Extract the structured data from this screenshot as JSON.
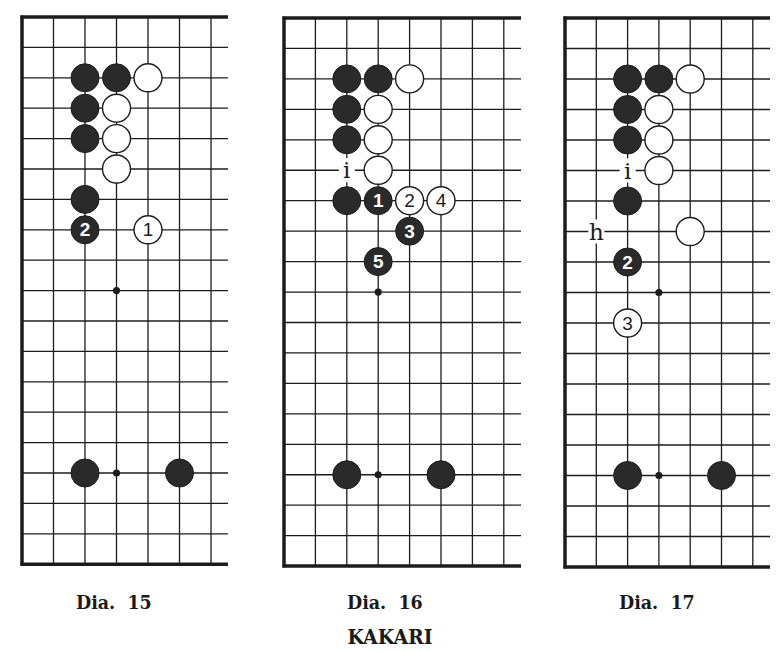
{
  "title": "KAKARI",
  "colors": {
    "ink": "#1c1c1c",
    "paper": "#ffffff",
    "black_stone": "#2a2a2a",
    "white_stone": "#ffffff"
  },
  "diagrams": [
    {
      "id": "dia-15",
      "caption": "Dia.  15",
      "caption_pos": {
        "x": 76,
        "y": 591
      },
      "origin": {
        "x": 22,
        "y": 17
      },
      "col_spacing": 31.5,
      "row_spacing": 30.4,
      "cols": 7,
      "rows": 19,
      "right_extent": 228,
      "star_points": [
        [
          3,
          9
        ],
        [
          3,
          15
        ]
      ],
      "stones": [
        {
          "c": 2,
          "r": 2,
          "color": "black"
        },
        {
          "c": 3,
          "r": 2,
          "color": "black"
        },
        {
          "c": 4,
          "r": 2,
          "color": "white"
        },
        {
          "c": 2,
          "r": 3,
          "color": "black"
        },
        {
          "c": 3,
          "r": 3,
          "color": "white"
        },
        {
          "c": 2,
          "r": 4,
          "color": "black"
        },
        {
          "c": 3,
          "r": 4,
          "color": "white"
        },
        {
          "c": 3,
          "r": 5,
          "color": "white"
        },
        {
          "c": 2,
          "r": 6,
          "color": "black"
        },
        {
          "c": 2,
          "r": 7,
          "color": "black",
          "label": "2"
        },
        {
          "c": 4,
          "r": 7,
          "color": "white",
          "label": "1"
        },
        {
          "c": 2,
          "r": 15,
          "color": "black"
        },
        {
          "c": 5,
          "r": 15,
          "color": "black"
        }
      ],
      "marks": []
    },
    {
      "id": "dia-16",
      "caption": "Dia.  16",
      "caption_pos": {
        "x": 347,
        "y": 591
      },
      "origin": {
        "x": 284,
        "y": 18
      },
      "col_spacing": 31.4,
      "row_spacing": 30.45,
      "cols": 8,
      "rows": 19,
      "right_extent": 521,
      "star_points": [
        [
          3,
          9
        ],
        [
          3,
          15
        ]
      ],
      "stones": [
        {
          "c": 2,
          "r": 2,
          "color": "black"
        },
        {
          "c": 3,
          "r": 2,
          "color": "black"
        },
        {
          "c": 4,
          "r": 2,
          "color": "white"
        },
        {
          "c": 2,
          "r": 3,
          "color": "black"
        },
        {
          "c": 3,
          "r": 3,
          "color": "white"
        },
        {
          "c": 2,
          "r": 4,
          "color": "black"
        },
        {
          "c": 3,
          "r": 4,
          "color": "white"
        },
        {
          "c": 3,
          "r": 5,
          "color": "white"
        },
        {
          "c": 2,
          "r": 6,
          "color": "black"
        },
        {
          "c": 3,
          "r": 6,
          "color": "black",
          "label": "1"
        },
        {
          "c": 4,
          "r": 6,
          "color": "white",
          "label": "2"
        },
        {
          "c": 5,
          "r": 6,
          "color": "white",
          "label": "4"
        },
        {
          "c": 4,
          "r": 7,
          "color": "black",
          "label": "3"
        },
        {
          "c": 3,
          "r": 8,
          "color": "black",
          "label": "5"
        },
        {
          "c": 2,
          "r": 15,
          "color": "black"
        },
        {
          "c": 5,
          "r": 15,
          "color": "black"
        }
      ],
      "marks": [
        {
          "c": 2,
          "r": 5,
          "label": "i"
        }
      ]
    },
    {
      "id": "dia-17",
      "caption": "Dia.  17",
      "caption_pos": {
        "x": 619,
        "y": 591
      },
      "origin": {
        "x": 565,
        "y": 18
      },
      "col_spacing": 31.3,
      "row_spacing": 30.5,
      "cols": 7,
      "rows": 19,
      "right_extent": 770,
      "star_points": [
        [
          3,
          9
        ],
        [
          3,
          15
        ]
      ],
      "stones": [
        {
          "c": 2,
          "r": 2,
          "color": "black"
        },
        {
          "c": 3,
          "r": 2,
          "color": "black"
        },
        {
          "c": 4,
          "r": 2,
          "color": "white"
        },
        {
          "c": 2,
          "r": 3,
          "color": "black"
        },
        {
          "c": 3,
          "r": 3,
          "color": "white"
        },
        {
          "c": 2,
          "r": 4,
          "color": "black"
        },
        {
          "c": 3,
          "r": 4,
          "color": "white"
        },
        {
          "c": 3,
          "r": 5,
          "color": "white"
        },
        {
          "c": 2,
          "r": 6,
          "color": "black"
        },
        {
          "c": 4,
          "r": 7,
          "color": "white"
        },
        {
          "c": 2,
          "r": 8,
          "color": "black",
          "label": "2"
        },
        {
          "c": 2,
          "r": 10,
          "color": "white",
          "label": "3"
        },
        {
          "c": 2,
          "r": 15,
          "color": "black"
        },
        {
          "c": 5,
          "r": 15,
          "color": "black"
        }
      ],
      "marks": [
        {
          "c": 2,
          "r": 5,
          "label": "i"
        },
        {
          "c": 1,
          "r": 7,
          "label": "h"
        }
      ]
    }
  ]
}
